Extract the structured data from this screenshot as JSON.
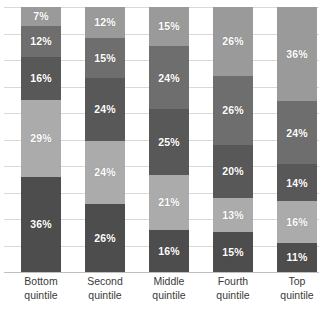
{
  "chart_data": {
    "type": "bar",
    "subtype": "stacked-100-percent",
    "title": "",
    "subtitle": "",
    "xlabel": "",
    "ylabel": "",
    "ylim": [
      0,
      100
    ],
    "grid": true,
    "gridline_interval": 10,
    "legend": "none",
    "orientation": "vertical",
    "value_suffix": "%",
    "categories": [
      "Bottom quintile",
      "Second quintile",
      "Middle quintile",
      "Fourth quintile",
      "Top quintile"
    ],
    "category_lines": [
      [
        "Bottom",
        "quintile"
      ],
      [
        "Second",
        "quintile"
      ],
      [
        "Middle",
        "quintile"
      ],
      [
        "Fourth",
        "quintile"
      ],
      [
        "Top",
        "quintile"
      ]
    ],
    "stack_order": "top-to-bottom",
    "series": [
      {
        "name": "segment-1",
        "color": "#9a9a9a",
        "values": [
          7,
          12,
          15,
          26,
          36
        ]
      },
      {
        "name": "segment-2",
        "color": "#6e6e6e",
        "values": [
          12,
          15,
          24,
          26,
          24
        ]
      },
      {
        "name": "segment-3",
        "color": "#585858",
        "values": [
          16,
          24,
          25,
          20,
          14
        ]
      },
      {
        "name": "segment-4",
        "color": "#ababab",
        "values": [
          29,
          24,
          21,
          13,
          16
        ]
      },
      {
        "name": "segment-5",
        "color": "#4d4d4d",
        "values": [
          36,
          26,
          16,
          15,
          11
        ]
      }
    ],
    "bars": [
      {
        "category": "Bottom quintile",
        "segments": [
          {
            "label": "7%",
            "value": 7,
            "color": "#9a9a9a"
          },
          {
            "label": "12%",
            "value": 12,
            "color": "#6e6e6e"
          },
          {
            "label": "16%",
            "value": 16,
            "color": "#585858"
          },
          {
            "label": "29%",
            "value": 29,
            "color": "#ababab"
          },
          {
            "label": "36%",
            "value": 36,
            "color": "#4d4d4d"
          }
        ]
      },
      {
        "category": "Second quintile",
        "segments": [
          {
            "label": "12%",
            "value": 12,
            "color": "#9a9a9a"
          },
          {
            "label": "15%",
            "value": 15,
            "color": "#6e6e6e"
          },
          {
            "label": "24%",
            "value": 24,
            "color": "#585858"
          },
          {
            "label": "24%",
            "value": 24,
            "color": "#ababab"
          },
          {
            "label": "26%",
            "value": 26,
            "color": "#4d4d4d"
          }
        ]
      },
      {
        "category": "Middle quintile",
        "segments": [
          {
            "label": "15%",
            "value": 15,
            "color": "#9a9a9a"
          },
          {
            "label": "24%",
            "value": 24,
            "color": "#6e6e6e"
          },
          {
            "label": "25%",
            "value": 25,
            "color": "#585858"
          },
          {
            "label": "21%",
            "value": 21,
            "color": "#ababab"
          },
          {
            "label": "16%",
            "value": 16,
            "color": "#4d4d4d"
          }
        ]
      },
      {
        "category": "Fourth quintile",
        "segments": [
          {
            "label": "26%",
            "value": 26,
            "color": "#9a9a9a"
          },
          {
            "label": "26%",
            "value": 26,
            "color": "#6e6e6e"
          },
          {
            "label": "20%",
            "value": 20,
            "color": "#585858"
          },
          {
            "label": "13%",
            "value": 13,
            "color": "#ababab"
          },
          {
            "label": "15%",
            "value": 15,
            "color": "#4d4d4d"
          }
        ]
      },
      {
        "category": "Top quintile",
        "segments": [
          {
            "label": "36%",
            "value": 36,
            "color": "#9a9a9a"
          },
          {
            "label": "24%",
            "value": 24,
            "color": "#6e6e6e"
          },
          {
            "label": "14%",
            "value": 14,
            "color": "#585858"
          },
          {
            "label": "16%",
            "value": 16,
            "color": "#ababab"
          },
          {
            "label": "11%",
            "value": 11,
            "color": "#4d4d4d"
          }
        ]
      }
    ]
  },
  "layout": {
    "bar_left_positions": [
      21,
      85,
      149,
      213,
      277
    ],
    "bar_width": 40,
    "plot_top": 7,
    "plot_height": 265,
    "gridline_color": "#d9d9d9",
    "baseline_color": "#bfbfbf",
    "label_color": "#3a3a3a",
    "segment_label_color": "#ffffff",
    "background": "#ffffff"
  }
}
